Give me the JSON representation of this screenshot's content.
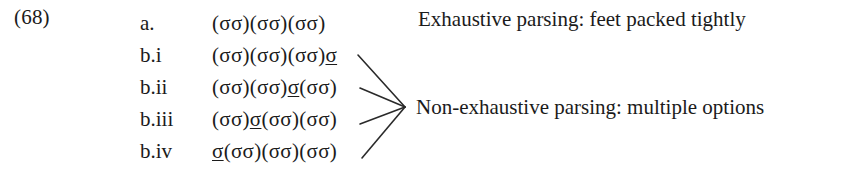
{
  "example": {
    "number": "(68)"
  },
  "rows": [
    {
      "label": "a.",
      "parse_prefix": "(σσ)(σσ)(σσ)",
      "stray": "",
      "parse_suffix": "",
      "top": 7
    },
    {
      "label": "b.i",
      "parse_prefix": "(σσ)(σσ)(σσ)",
      "stray": "σ",
      "parse_suffix": "",
      "top": 39
    },
    {
      "label": "b.ii",
      "parse_prefix": "(σσ)(σσ)",
      "stray": "σ",
      "parse_suffix": "(σσ)",
      "top": 71
    },
    {
      "label": "b.iii",
      "parse_prefix": "(σσ)",
      "stray": "σ",
      "parse_suffix": "(σσ)(σσ)",
      "top": 103
    },
    {
      "label": "b.iv",
      "parse_prefix": "",
      "stray": "σ",
      "parse_suffix": "(σσ)(σσ)(σσ)",
      "top": 135
    }
  ],
  "annotations": {
    "exhaustive": "Exhaustive parsing: feet packed tightly",
    "non_exhaustive": "Non-exhaustive parsing: multiple options"
  },
  "colors": {
    "text": "#1b1b1b",
    "rule": "#2a2a2a",
    "background": "#ffffff"
  }
}
